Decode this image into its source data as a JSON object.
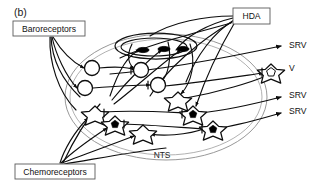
{
  "figure": {
    "panel_label": "(b)",
    "region_label": "NTS",
    "title": ""
  },
  "inputs": [
    {
      "id": "baroreceptors",
      "label": "Baroreceptors",
      "x": 13,
      "y": 21,
      "w": 72,
      "h": 15
    },
    {
      "id": "chemoreceptors",
      "label": "Chemoreceptors",
      "x": 15,
      "y": 164,
      "w": 80,
      "h": 15
    }
  ],
  "modulator": {
    "id": "hda",
    "label": "HDA",
    "x": 233,
    "y": 8,
    "w": 37,
    "h": 16
  },
  "outputs": [
    {
      "id": "output-srv-1",
      "label": "SRV",
      "x": 289,
      "y": 48
    },
    {
      "id": "output-v",
      "label": "V",
      "x": 289,
      "y": 71
    },
    {
      "id": "output-srv-2",
      "label": "SRV",
      "x": 289,
      "y": 98
    },
    {
      "id": "output-srv-3",
      "label": "SRV",
      "x": 289,
      "y": 114
    }
  ],
  "nts_boundary": {
    "cx": 166,
    "cy": 97,
    "rx": 101,
    "ry": 63,
    "label": "NTS",
    "label_x": 162,
    "label_y": 158
  },
  "inner_nucleus": {
    "cx": 156,
    "cy": 46,
    "rx": 41,
    "ry": 13
  },
  "neurons_open_circle": [
    {
      "id": "circle-1",
      "cx": 92,
      "cy": 68,
      "r": 7.5
    },
    {
      "id": "circle-2",
      "cx": 85,
      "cy": 88,
      "r": 7.5
    },
    {
      "id": "circle-3",
      "cx": 141,
      "cy": 70,
      "r": 7.5
    },
    {
      "id": "circle-4",
      "cx": 158,
      "cy": 85,
      "r": 7.5
    }
  ],
  "neurons_filled_ellipse": [
    {
      "id": "ellipse-1",
      "cx": 143,
      "cy": 50,
      "rx": 6,
      "ry": 2.6
    },
    {
      "id": "ellipse-2",
      "cx": 164,
      "cy": 49,
      "rx": 6,
      "ry": 2.6
    },
    {
      "id": "ellipse-3",
      "cx": 183,
      "cy": 49,
      "rx": 6,
      "ry": 2.6
    }
  ],
  "neurons_star_open": [
    {
      "id": "star-open-1",
      "cx": 95,
      "cy": 114,
      "r": 8
    },
    {
      "id": "star-open-2",
      "cx": 178,
      "cy": 100,
      "r": 8
    },
    {
      "id": "star-open-3",
      "cx": 143,
      "cy": 133,
      "r": 8
    }
  ],
  "neurons_star_filled": [
    {
      "id": "star-filled-1",
      "cx": 115,
      "cy": 124,
      "r": 8
    },
    {
      "id": "star-filled-2",
      "cx": 193,
      "cy": 114,
      "r": 8
    },
    {
      "id": "star-filled-3",
      "cx": 213,
      "cy": 129,
      "r": 8
    }
  ],
  "neurons_star_ring": [
    {
      "id": "star-ring-1",
      "cx": 271,
      "cy": 72,
      "r": 8
    }
  ],
  "colors": {
    "line": "#0d0d0d",
    "boundary": "#8c8c8c",
    "box_border": "#5a5a5a",
    "text": "#111111",
    "background": "#ffffff"
  }
}
